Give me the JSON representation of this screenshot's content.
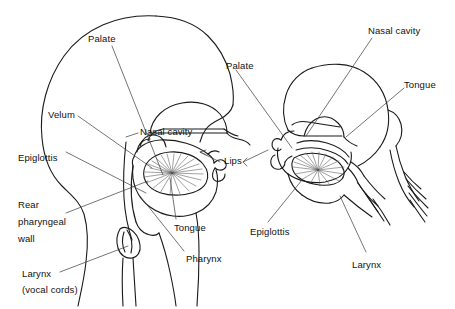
{
  "figure": {
    "background_color": "#ffffff",
    "stroke_color": "#1a1a1a",
    "text_color": "#111111",
    "hatch_color": "#555555",
    "width": 455,
    "height": 309
  },
  "views": [
    {
      "id": "left-head",
      "name": "upright-head-sagittal-view",
      "description": "Full human head in profile facing right, midsagittal section showing vocal tract"
    },
    {
      "id": "right-head",
      "name": "tilted-head-detail-view",
      "description": "Rotated / reclined head detail showing same vocal tract structures"
    }
  ],
  "labels": {
    "left": [
      {
        "id": "palate",
        "text": "Palate",
        "x": 88,
        "y": 33,
        "name": "label-palate-left"
      },
      {
        "id": "velum",
        "text": "Velum",
        "x": 48,
        "y": 109,
        "name": "label-velum"
      },
      {
        "id": "epiglottis",
        "text": "Epiglottis",
        "x": 18,
        "y": 152,
        "name": "label-epiglottis-left"
      },
      {
        "id": "rear_wall",
        "text": "Rear",
        "x": 18,
        "y": 199,
        "name": "label-rear-pharyngeal-wall-line1"
      },
      {
        "id": "rear_wall2",
        "text": "pharyngeal",
        "x": 18,
        "y": 216,
        "name": "label-rear-pharyngeal-wall-line2"
      },
      {
        "id": "rear_wall3",
        "text": "wall",
        "x": 18,
        "y": 233,
        "name": "label-rear-pharyngeal-wall-line3"
      },
      {
        "id": "larynx",
        "text": "Larynx",
        "x": 22,
        "y": 268,
        "name": "label-larynx-left-line1"
      },
      {
        "id": "larynx2",
        "text": "(vocal cords)",
        "x": 22,
        "y": 284,
        "name": "label-larynx-left-line2"
      },
      {
        "id": "nasal",
        "text": "Nasal cavity",
        "x": 140,
        "y": 126,
        "name": "label-nasal-cavity-left"
      },
      {
        "id": "tongue",
        "text": "Tongue",
        "x": 174,
        "y": 222,
        "name": "label-tongue-left"
      },
      {
        "id": "pharynx",
        "text": "Pharynx",
        "x": 186,
        "y": 253,
        "name": "label-pharynx"
      },
      {
        "id": "lips",
        "text": "Lips",
        "x": 224,
        "y": 160,
        "name": "label-lips"
      }
    ],
    "right": [
      {
        "id": "palate_r",
        "text": "Palate",
        "x": 226,
        "y": 60,
        "name": "label-palate-right"
      },
      {
        "id": "nasal_r",
        "text": "Nasal cavity",
        "x": 368,
        "y": 25,
        "name": "label-nasal-cavity-right"
      },
      {
        "id": "tongue_r",
        "text": "Tongue",
        "x": 404,
        "y": 79,
        "name": "label-tongue-right"
      },
      {
        "id": "epiglottis_r",
        "text": "Epiglottis",
        "x": 250,
        "y": 226,
        "name": "label-epiglottis-right"
      },
      {
        "id": "larynx_r",
        "text": "Larynx",
        "x": 352,
        "y": 259,
        "name": "label-larynx-right"
      }
    ]
  },
  "leader_lines": {
    "count": 17,
    "style": "thin straight hairlines from label text to anatomical structure"
  }
}
